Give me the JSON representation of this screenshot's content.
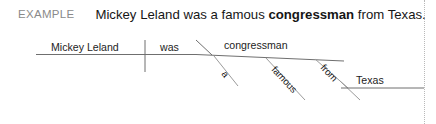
{
  "header": {
    "example_label": "EXAMPLE",
    "sentence_before": "Mickey Leland was a famous ",
    "sentence_bold": "congressman",
    "sentence_after": " from Texas."
  },
  "diagram": {
    "type": "sentence-diagram",
    "subject": "Mickey Leland",
    "verb": "was",
    "predicate_nominative": "congressman",
    "modifiers": [
      {
        "word": "a",
        "type": "article",
        "modifies": "congressman"
      },
      {
        "word": "famous",
        "type": "adjective",
        "modifies": "congressman"
      }
    ],
    "prepositional_phrase": {
      "preposition": "from",
      "object": "Texas",
      "modifies": "congressman"
    }
  }
}
